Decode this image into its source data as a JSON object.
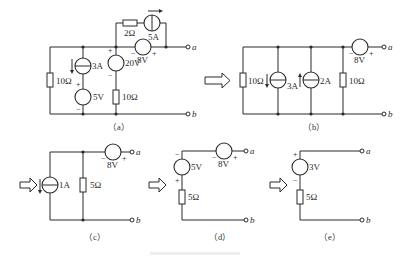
{
  "figure": {
    "caption_faint": "",
    "transform_arrows": 4
  },
  "circuits": {
    "a": {
      "caption": "（a）",
      "resistor_left": "10Ω",
      "current_source_3a": "3A",
      "voltage_source_5v": "5V",
      "voltage_source_20v": "20V",
      "resistor_mid": "10Ω",
      "resistor_top": "2Ω",
      "current_source_5a": "5A",
      "voltage_source_8v": "8V",
      "terminal_a": "a",
      "terminal_b": "b",
      "plus": "+",
      "minus": "−"
    },
    "b": {
      "caption": "（b）",
      "resistor_left": "10Ω",
      "current_source_3a": "3A",
      "current_source_2a": "2A",
      "resistor_right": "10Ω",
      "voltage_source_8v": "8V",
      "terminal_a": "a",
      "terminal_b": "b",
      "plus": "+",
      "minus": "−"
    },
    "c": {
      "caption": "（c）",
      "current_source_1a": "1A",
      "resistor": "5Ω",
      "voltage_source_8v": "8V",
      "terminal_a": "a",
      "terminal_b": "b",
      "plus": "+",
      "minus": "−"
    },
    "d": {
      "caption": "（d）",
      "voltage_source_5v": "5V",
      "voltage_source_8v": "8V",
      "resistor": "5Ω",
      "terminal_a": "a",
      "terminal_b": "b",
      "plus": "+",
      "minus": "−"
    },
    "e": {
      "caption": "（e）",
      "voltage_source_3v": "3V",
      "resistor": "5Ω",
      "terminal_a": "a",
      "terminal_b": "b",
      "plus": "+",
      "minus": "−"
    }
  }
}
